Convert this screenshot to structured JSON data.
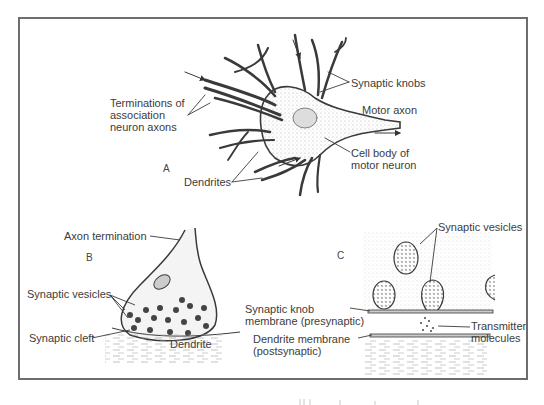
{
  "figure": {
    "panels": [
      {
        "id": "A",
        "letter": "A",
        "title": "Motor neuron with synaptic knobs",
        "labels": {
          "terminations": [
            "Terminations of",
            "association",
            "neuron axons"
          ],
          "synaptic_knobs": "Synaptic knobs",
          "motor_axon": "Motor axon",
          "cell_body": [
            "Cell body of",
            "motor neuron"
          ],
          "dendrites": "Dendrites"
        }
      },
      {
        "id": "B",
        "letter": "B",
        "title": "Axon termination on dendrite",
        "labels": {
          "axon_termination": "Axon termination",
          "synaptic_vesicles": "Synaptic vesicles",
          "synaptic_cleft": "Synaptic cleft",
          "dendrite": "Dendrite"
        }
      },
      {
        "id": "C",
        "letter": "C",
        "title": "Synapse detail",
        "labels": {
          "synaptic_vesicles": "Synaptic vesicles",
          "knob_membrane": [
            "Synaptic knob",
            "membrane (presynaptic)"
          ],
          "dendrite_membrane": [
            "Dendrite membrane",
            "(postsynaptic)"
          ],
          "transmitter": [
            "Transmitter",
            "molecules"
          ]
        }
      }
    ],
    "colors": {
      "frame": "#6d6d6d",
      "ink": "#3a3a3a",
      "stipple": "#bdbdbd",
      "background": "#ffffff"
    }
  }
}
